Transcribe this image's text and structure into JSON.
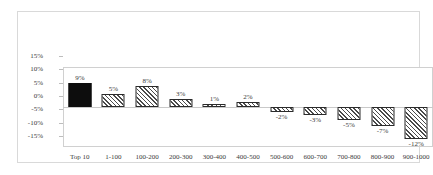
{
  "chart_data": {
    "type": "bar",
    "title": "",
    "subtitle": "",
    "xlabel": "",
    "ylabel": "",
    "categories": [
      "Top 10",
      "1-100",
      "100-200",
      "200-300",
      "300-400",
      "400-500",
      "500-600",
      "600-700",
      "700-800",
      "800-900",
      "900-1000"
    ],
    "values": [
      9,
      5,
      8,
      3,
      1,
      2,
      -2,
      -3,
      -5,
      -7,
      -12
    ],
    "data_labels": [
      "9%",
      "5%",
      "8%",
      "3%",
      "1%",
      "2%",
      "-2%",
      "-3%",
      "-5%",
      "-7%",
      "-12%"
    ],
    "series": [
      {
        "name": "",
        "values": [
          9,
          5,
          8,
          3,
          1,
          2,
          -2,
          -3,
          -5,
          -7,
          -12
        ]
      }
    ],
    "bar_styles": [
      "solid",
      "hatch",
      "hatch",
      "hatch",
      "hatch",
      "hatch",
      "hatch",
      "hatch",
      "hatch",
      "hatch",
      "hatch"
    ],
    "ylim": [
      -15,
      15
    ],
    "ytick_values": [
      15,
      10,
      5,
      0,
      -5,
      -10,
      -15
    ],
    "ytick_labels": [
      "15%",
      "10%",
      "5%",
      "0%",
      "-5%",
      "-10%",
      "-15%"
    ],
    "grid": false,
    "legend": "none",
    "zero_line": true,
    "colors": {
      "highlight_bar": "#0d0d0d",
      "bar_outline": "#2b2b2b",
      "hatch_line": "#4a4a4a",
      "plot_border": "#d0d0d0",
      "frame_border": "#d9d9d9",
      "zero_line": "#c9c9c9",
      "text": "#3a3a3a",
      "background": "#ffffff"
    }
  }
}
